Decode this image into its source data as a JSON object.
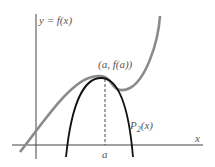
{
  "labels": {
    "function": "y = f(x)",
    "point": "(a, f(a))",
    "taylor": "P",
    "taylor_sub": "2",
    "taylor_arg": "(x)",
    "x_axis": "x",
    "a_tick": "a"
  },
  "colors": {
    "function_curve": "#8a8a8a",
    "taylor_curve": "#111111",
    "axes": "#444444"
  }
}
